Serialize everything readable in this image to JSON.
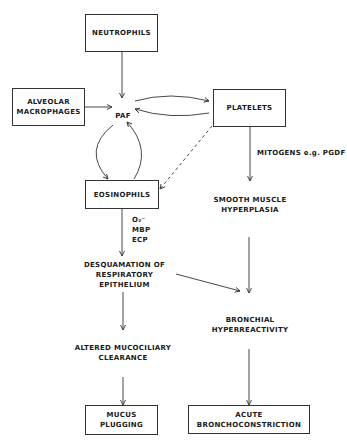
{
  "diagram": {
    "nodes": {
      "neutrophils": "NEUTROPHILS",
      "alveolar_macrophages": "ALVEOLAR\nMACROPHAGES",
      "paf": "PAF",
      "platelets": "PLATELETS",
      "eosinophils": "EOSINOPHILS",
      "mitogens": "MITOGENS e.g. PGDF",
      "smooth_muscle": "SMOOTH MUSCLE\nHYPERPLASIA",
      "eos_products": "O₂⁻\nMBP\nECP",
      "desquamation": "DESQUAMATION OF\nRESPIRATORY\nEPITHELIUM",
      "bronchial_hyperreactivity": "BRONCHIAL\nHYPERREACTIVITY",
      "altered_mucociliary": "ALTERED  MUCOCILIARY\nCLEARANCE",
      "mucus_plugging": "MUCUS\nPLUGGING",
      "acute_bronchoconstriction": "ACUTE\nBRONCHOCONSTRICTION"
    },
    "edges": [
      {
        "from": "neutrophils",
        "to": "paf",
        "style": "solid"
      },
      {
        "from": "alveolar_macrophages",
        "to": "paf",
        "style": "solid"
      },
      {
        "from": "paf",
        "to": "platelets",
        "style": "solid"
      },
      {
        "from": "platelets",
        "to": "paf",
        "style": "solid"
      },
      {
        "from": "paf",
        "to": "eosinophils",
        "style": "solid"
      },
      {
        "from": "eosinophils",
        "to": "paf",
        "style": "solid"
      },
      {
        "from": "platelets",
        "to": "eosinophils",
        "style": "dashed"
      },
      {
        "from": "platelets",
        "to": "smooth_muscle",
        "style": "solid",
        "label": "MITOGENS e.g. PGDF"
      },
      {
        "from": "eosinophils",
        "to": "desquamation",
        "style": "solid",
        "label": "O2- MBP ECP"
      },
      {
        "from": "desquamation",
        "to": "bronchial_hyperreactivity",
        "style": "solid"
      },
      {
        "from": "smooth_muscle",
        "to": "bronchial_hyperreactivity",
        "style": "solid"
      },
      {
        "from": "desquamation",
        "to": "altered_mucociliary",
        "style": "solid"
      },
      {
        "from": "altered_mucociliary",
        "to": "mucus_plugging",
        "style": "solid"
      },
      {
        "from": "bronchial_hyperreactivity",
        "to": "acute_bronchoconstriction",
        "style": "solid"
      }
    ],
    "colors": {
      "line": "#333333",
      "text": "#1a1a1a",
      "background": "#ffffff"
    }
  }
}
